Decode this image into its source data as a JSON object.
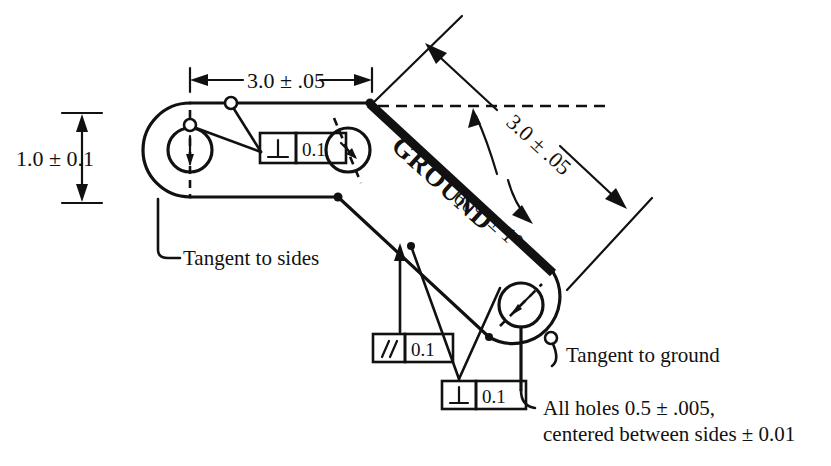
{
  "drawing": {
    "title_label": "GROUND",
    "dimensions": {
      "height_dim": "1.0 ± 0.1",
      "horizontal_dim": "3.0 ± .05",
      "diagonal_dim": "3.0 ± .05",
      "angle_dim_line1": "60°",
      "angle_dim_line2": "± 1°"
    },
    "notes": {
      "tangent_sides": "Tangent to sides",
      "tangent_ground": "Tangent to ground",
      "holes_line1": "All holes 0.5 ± .005,",
      "holes_line2": "centered between sides ± 0.01"
    },
    "feature_control_frames": [
      {
        "id": "fcf-top-left",
        "symbol": "perpendicularity",
        "symbol_glyph": "⊥",
        "tolerance": "0.1"
      },
      {
        "id": "fcf-bottom-left",
        "symbol": "parallelism",
        "symbol_glyph": "∥",
        "tolerance": "0.1"
      },
      {
        "id": "fcf-bottom-center",
        "symbol": "perpendicularity",
        "symbol_glyph": "⊥",
        "tolerance": "0.1"
      }
    ],
    "colors": {
      "line": "#111111",
      "background": "#ffffff"
    }
  }
}
